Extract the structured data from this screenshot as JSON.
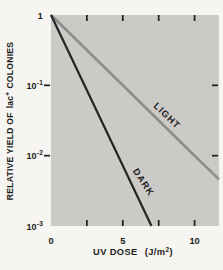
{
  "figure": {
    "bg_color": "#f6f5f1",
    "text_color": "#1c1c1c"
  },
  "chart_data": {
    "type": "line",
    "title": "",
    "xlabel": "UV DOSE (J/m²)",
    "xlabel_parts": {
      "main": "UV DOSE",
      "paren_open": "(J/m",
      "exp": "2",
      "paren_close": ")"
    },
    "ylabel": "RELATIVE YIELD OF lac⁺ COLONIES",
    "ylabel_parts": {
      "pre": "RELATIVE YIELD OF",
      "gene": "lac",
      "sup": "+",
      "post": "COLONIES"
    },
    "plot_bg": "#cbcac6",
    "grid": "off",
    "x_axis": {
      "min": 0,
      "max": 11.7,
      "tick_values": [
        2.5,
        5,
        7.5,
        10
      ],
      "labeled_ticks": [
        {
          "value": 0,
          "label": "0"
        },
        {
          "value": 5,
          "label": "5"
        },
        {
          "value": 10,
          "label": "10"
        }
      ]
    },
    "y_axis": {
      "scale": "log",
      "min": 0.001,
      "max": 1,
      "side_tick_values": [
        0.1,
        0.01
      ],
      "tick_labels": [
        {
          "base": "1",
          "exp": ""
        },
        {
          "base": "10",
          "exp": "-1"
        },
        {
          "base": "10",
          "exp": "-2"
        },
        {
          "base": "10",
          "exp": "-3"
        }
      ]
    },
    "series": [
      {
        "name": "LIGHT",
        "color": "#8d8d8c",
        "width": 2.6,
        "points": [
          {
            "x": 0,
            "y": 1
          },
          {
            "x": 5,
            "y": 0.1
          },
          {
            "x": 10,
            "y": 0.01
          },
          {
            "x": 11.7,
            "y": 0.0046
          }
        ]
      },
      {
        "name": "DARK",
        "color": "#242424",
        "width": 2.2,
        "points": [
          {
            "x": 0,
            "y": 1
          },
          {
            "x": 2.33,
            "y": 0.1
          },
          {
            "x": 4.67,
            "y": 0.01
          },
          {
            "x": 7.0,
            "y": 0.001
          }
        ]
      }
    ]
  }
}
